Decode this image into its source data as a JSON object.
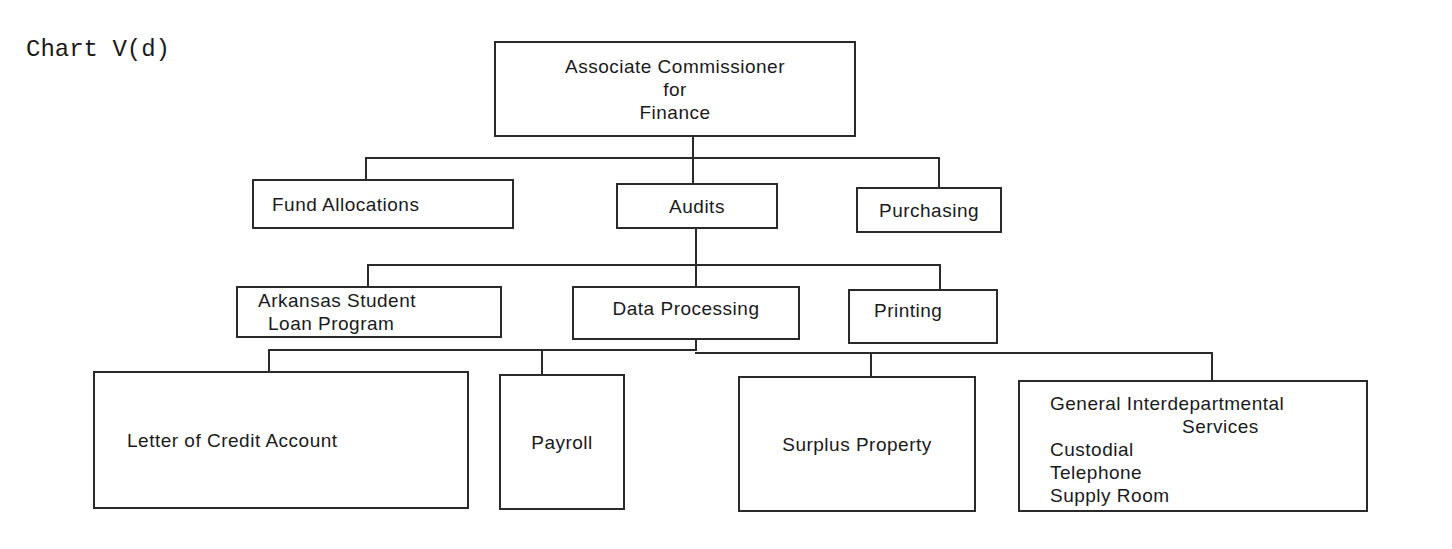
{
  "caption": "Chart V(d)",
  "root": {
    "lines": [
      "Associate Commissioner",
      "for",
      "Finance"
    ]
  },
  "level1": [
    {
      "label": "Fund Allocations"
    },
    {
      "label": "Audits"
    },
    {
      "label": "Purchasing"
    }
  ],
  "level2": [
    {
      "lines": [
        "Arkansas Student",
        "Loan Program"
      ]
    },
    {
      "label": "Data Processing"
    },
    {
      "label": "Printing"
    }
  ],
  "level3": [
    {
      "label": "Letter of Credit Account"
    },
    {
      "label": "Payroll"
    },
    {
      "label": "Surplus Property"
    },
    {
      "title": [
        "General Interdepartmental",
        "Services"
      ],
      "items": [
        "Custodial",
        "Telephone",
        "Supply Room"
      ]
    }
  ]
}
